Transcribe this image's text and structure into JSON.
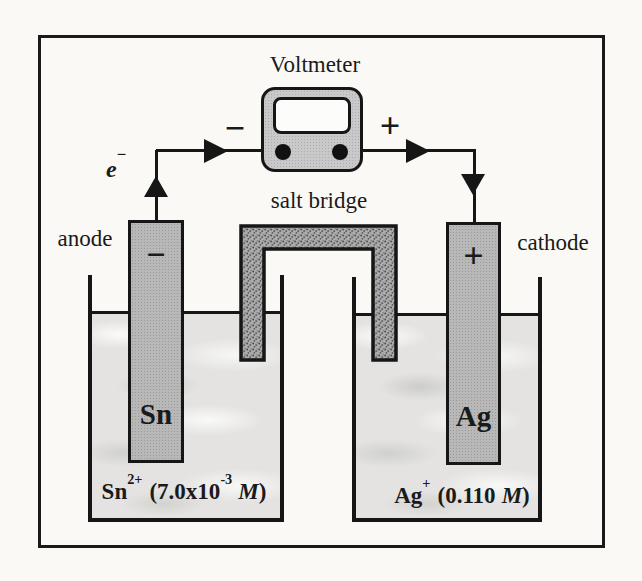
{
  "voltmeter": {
    "label": "Voltmeter",
    "negative_terminal_sign": "−",
    "positive_terminal_sign": "+"
  },
  "salt_bridge": {
    "label": "salt bridge"
  },
  "electron_flow": {
    "symbol": "e",
    "charge": "−"
  },
  "anode": {
    "label": "anode",
    "electrode_sign": "−",
    "metal": "Sn",
    "solution": {
      "symbol": "Sn",
      "charge": "2+",
      "concentration_open": "(7.0x10",
      "exponent": "-3",
      "molarity_symbol": "M",
      "close": ")"
    }
  },
  "cathode": {
    "label": "cathode",
    "electrode_sign": "+",
    "metal": "Ag",
    "solution": {
      "symbol": "Ag",
      "charge": "+",
      "concentration_open": "(0.110",
      "molarity_symbol": "M",
      "close": ")"
    }
  },
  "colors": {
    "line": "#161616",
    "electrode_fill": "#b8b8b8",
    "voltmeter_fill": "#c9c9c9",
    "salt_bridge_fill": "#adadad",
    "solution_fill": "#e4e3e1",
    "background": "#faf9f6"
  }
}
